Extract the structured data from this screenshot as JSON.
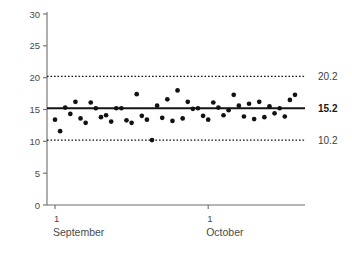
{
  "chart_data": {
    "type": "scatter",
    "title": "",
    "subtitle": "",
    "xlabel": "",
    "ylabel": "",
    "ylim": [
      0,
      30
    ],
    "yticks": [
      0,
      5,
      10,
      15,
      20,
      25,
      30
    ],
    "ytick_labels": [
      "0",
      "5",
      "10",
      "15",
      "20",
      "25",
      "30"
    ],
    "xtick_positions": [
      1,
      31
    ],
    "xtick_labels": [
      "1",
      "1"
    ],
    "xtick_month_labels": [
      "September",
      "October"
    ],
    "grid": false,
    "legend": "none",
    "annotations": [
      {
        "name": "upper-control-limit",
        "value": 20.2,
        "label": "20.2",
        "style": "dotted"
      },
      {
        "name": "center-line",
        "value": 15.2,
        "label": "15.2",
        "style": "solid",
        "bold": true
      },
      {
        "name": "lower-control-limit",
        "value": 10.2,
        "label": "10.2",
        "style": "dotted"
      }
    ],
    "series": [
      {
        "name": "observations",
        "marker": "filled-circle",
        "color": "#121212",
        "x": [
          1,
          2,
          3,
          4,
          5,
          6,
          7,
          8,
          9,
          10,
          11,
          12,
          13,
          14,
          15,
          16,
          17,
          18,
          19,
          20,
          21,
          22,
          23,
          24,
          25,
          26,
          27,
          28,
          29,
          30,
          31,
          32,
          33,
          34,
          35,
          36,
          37,
          38,
          39,
          40,
          41,
          42,
          43,
          44,
          45,
          46,
          47,
          48
        ],
        "values": [
          13.4,
          11.6,
          15.3,
          14.3,
          16.2,
          13.6,
          12.9,
          16.1,
          15.2,
          13.8,
          14.1,
          13.1,
          15.2,
          15.2,
          13.3,
          12.9,
          17.4,
          14.0,
          13.4,
          10.2,
          15.6,
          13.7,
          16.6,
          13.2,
          18.0,
          13.6,
          16.2,
          15.1,
          15.2,
          14.0,
          13.4,
          16.1,
          15.3,
          14.1,
          14.9,
          17.3,
          15.6,
          13.9,
          15.9,
          13.5,
          16.2,
          13.8,
          15.5,
          14.4,
          15.2,
          13.9,
          16.5,
          17.3
        ]
      }
    ]
  }
}
